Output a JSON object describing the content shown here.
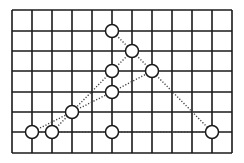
{
  "diagram": {
    "background": "#ffffff",
    "grid": {
      "x0": 12,
      "x1": 232,
      "xs": [
        12,
        32,
        52,
        72,
        92,
        112,
        132,
        152,
        172,
        192,
        212,
        232
      ],
      "ys": [
        10,
        31,
        51,
        71,
        92,
        112,
        132,
        153
      ],
      "color": "#1a1a1a",
      "stroke_width": 1.6
    },
    "nodes": [
      {
        "id": "a",
        "x": 112,
        "y": 31
      },
      {
        "id": "b",
        "x": 132,
        "y": 51
      },
      {
        "id": "c",
        "x": 112,
        "y": 71
      },
      {
        "id": "d",
        "x": 152,
        "y": 71
      },
      {
        "id": "e",
        "x": 112,
        "y": 92
      },
      {
        "id": "f",
        "x": 72,
        "y": 112
      },
      {
        "id": "g",
        "x": 32,
        "y": 132
      },
      {
        "id": "h",
        "x": 52,
        "y": 132
      },
      {
        "id": "i",
        "x": 112,
        "y": 132
      },
      {
        "id": "j",
        "x": 212,
        "y": 132
      }
    ],
    "node_radius": 6.5,
    "node_fill": "#ffffff",
    "node_stroke": "#1a1a1a",
    "edges": [
      {
        "from": "g",
        "to": "f"
      },
      {
        "from": "f",
        "to": "e"
      },
      {
        "from": "e",
        "to": "d"
      },
      {
        "from": "h",
        "to": "c"
      },
      {
        "from": "c",
        "to": "b"
      },
      {
        "from": "a",
        "to": "b"
      },
      {
        "from": "b",
        "to": "d"
      },
      {
        "from": "d",
        "to": "j"
      },
      {
        "from": "a",
        "to": "c"
      },
      {
        "from": "c",
        "to": "e"
      },
      {
        "from": "e",
        "to": "i"
      },
      {
        "from": "g",
        "to": "h"
      },
      {
        "from": "h",
        "to": "i"
      },
      {
        "from": "i",
        "to": "j"
      }
    ],
    "edge_color": "#444444",
    "edge_dash": "1.2 1.8"
  }
}
